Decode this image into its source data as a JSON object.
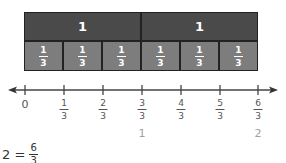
{
  "bar_model": {
    "wholes": [
      {
        "label": "1"
      },
      {
        "label": "1"
      }
    ],
    "thirds": [
      {
        "num": "1",
        "den": "3"
      },
      {
        "num": "1",
        "den": "3"
      },
      {
        "num": "1",
        "den": "3"
      },
      {
        "num": "1",
        "den": "3"
      },
      {
        "num": "1",
        "den": "3"
      },
      {
        "num": "1",
        "den": "3"
      }
    ],
    "colors": {
      "whole": "#4a4a4a",
      "third": "#7d7d7d",
      "border": "#222222"
    }
  },
  "number_line": {
    "zero_label": "0",
    "ticks": [
      {
        "num": "1",
        "den": "3"
      },
      {
        "num": "2",
        "den": "3"
      },
      {
        "num": "3",
        "den": "3"
      },
      {
        "num": "4",
        "den": "3"
      },
      {
        "num": "5",
        "den": "3"
      },
      {
        "num": "6",
        "den": "3"
      }
    ],
    "whole_labels": [
      {
        "at": "3/3",
        "label": "1"
      },
      {
        "at": "6/3",
        "label": "2"
      }
    ]
  },
  "equation": {
    "left": "2 =",
    "num": "6",
    "den": "3"
  }
}
